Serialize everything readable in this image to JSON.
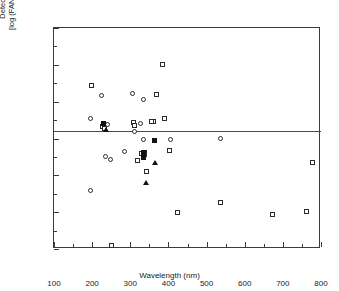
{
  "chart_data": {
    "type": "scatter",
    "title": "",
    "xlabel": "Wavelength (nm)",
    "ylabel_line1": "Detection Limits",
    "ylabel_line2": "[log (FANES/GF-AAS)]",
    "xlim": [
      100,
      800
    ],
    "ylim": [
      -3,
      3
    ],
    "xticks": [
      100,
      200,
      300,
      400,
      500,
      600,
      700,
      800
    ],
    "yticks": [
      3,
      2,
      1,
      0,
      -1,
      -2,
      -3
    ],
    "xtick_labels": [
      "100",
      "200",
      "300",
      "400",
      "500",
      "600",
      "700",
      "800"
    ],
    "ytick_labels": [
      "3",
      "2",
      "1",
      "0",
      "-1",
      "-2",
      "-3"
    ],
    "xminor_step": 50,
    "yminor_step": 0.5,
    "grid": false,
    "legend": "none",
    "reference_line_y": 0,
    "series": [
      {
        "name": "open-square",
        "marker": "open-square",
        "points": [
          [
            198,
            1.43
          ],
          [
            250,
            -2.9
          ],
          [
            308,
            0.44
          ],
          [
            310,
            0.36
          ],
          [
            318,
            -0.6
          ],
          [
            330,
            -0.42
          ],
          [
            336,
            -0.43
          ],
          [
            338,
            -0.37
          ],
          [
            342,
            -0.9
          ],
          [
            362,
            0.46
          ],
          [
            370,
            1.2
          ],
          [
            385,
            2.0
          ],
          [
            390,
            0.53
          ],
          [
            404,
            -0.32
          ],
          [
            424,
            -2.02
          ],
          [
            536,
            -1.74
          ],
          [
            672,
            -2.06
          ],
          [
            762,
            -1.97
          ],
          [
            778,
            -0.66
          ],
          [
            228,
            0.33
          ],
          [
            232,
            0.27
          ],
          [
            356,
            0.45
          ]
        ]
      },
      {
        "name": "open-circle",
        "marker": "open-circle",
        "points": [
          [
            196,
            0.54
          ],
          [
            197,
            -1.41
          ],
          [
            224,
            1.17
          ],
          [
            234,
            -0.48
          ],
          [
            240,
            0.38
          ],
          [
            247,
            -0.57
          ],
          [
            284,
            -0.36
          ],
          [
            305,
            1.23
          ],
          [
            310,
            0.2
          ],
          [
            326,
            0.41
          ],
          [
            334,
            1.05
          ],
          [
            334,
            -0.04
          ],
          [
            337,
            -0.47
          ],
          [
            406,
            -0.04
          ],
          [
            537,
            0.01
          ]
        ]
      },
      {
        "name": "filled-square",
        "marker": "filled-square",
        "points": [
          [
            231,
            0.4
          ],
          [
            334,
            -0.38
          ],
          [
            334,
            -0.46
          ],
          [
            335,
            -0.52
          ],
          [
            363,
            -0.05
          ]
        ]
      },
      {
        "name": "filled-triangle",
        "marker": "filled-triangle",
        "points": [
          [
            236,
            0.22
          ],
          [
            341,
            -1.2
          ],
          [
            364,
            -0.66
          ]
        ]
      }
    ]
  },
  "axes": {
    "x_title": "Wavelength (nm)",
    "y_title_line1": "Detection Limits",
    "y_title_line2": "[log (FANES/GF-AAS)]"
  }
}
